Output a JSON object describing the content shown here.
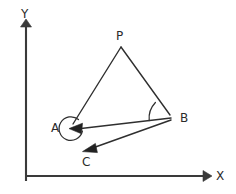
{
  "figure": {
    "width": 236,
    "height": 194,
    "background_color": "#ffffff",
    "stroke_color": "#2f2f2f",
    "axis_color": "#3a3a3a",
    "label_color": "#2b2b2b"
  },
  "axes": {
    "x": {
      "label": "X",
      "label_x": 216,
      "label_y": 170,
      "start_x": 26,
      "start_y": 176,
      "end_x": 203,
      "end_y": 176
    },
    "y": {
      "label": "Y",
      "label_x": 21,
      "label_y": 8,
      "start_x": 26,
      "start_y": 181,
      "end_x": 26,
      "end_y": 27
    }
  },
  "points": [
    {
      "id": "P",
      "label": "P",
      "x": 121,
      "y": 47,
      "label_x": 116,
      "label_y": 30,
      "marker": "none"
    },
    {
      "id": "A",
      "label": "A",
      "x": 71,
      "y": 128,
      "label_x": 51,
      "label_y": 122,
      "marker": "arrowhead"
    },
    {
      "id": "B",
      "label": "B",
      "x": 172,
      "y": 118,
      "label_x": 180,
      "label_y": 112,
      "marker": "arrowhead"
    },
    {
      "id": "C",
      "label": "C",
      "x": 84,
      "y": 150,
      "label_x": 82,
      "label_y": 156,
      "marker": "arrowhead"
    }
  ],
  "segments": [
    {
      "id": "PA",
      "from": "P",
      "to": "A",
      "arrow": false
    },
    {
      "id": "PB",
      "from": "P",
      "to": "B",
      "arrow": false
    },
    {
      "id": "BA",
      "from": "B",
      "to": "A",
      "arrow": true
    },
    {
      "id": "BC",
      "from": "B",
      "to": "C",
      "arrow": true
    }
  ],
  "arcs": [
    {
      "id": "angle-at-A",
      "center": "A",
      "radius": 12,
      "type": "reflex-circle"
    },
    {
      "id": "angle-at-B",
      "center": "B",
      "radius": 23,
      "type": "angle-sector"
    }
  ]
}
